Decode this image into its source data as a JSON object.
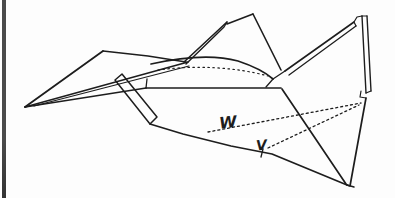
{
  "colors": {
    "ink": "#1d1d1d",
    "paper": "#fdfdfd",
    "left_bar": "#4b4b4b"
  },
  "figure": {
    "labels": [
      {
        "id": "W",
        "text": "W"
      },
      {
        "id": "V",
        "text": "V"
      }
    ],
    "paths": [
      {
        "name": "left-wing-top-edge",
        "d": "M25,107 L103,51",
        "w": 1.8
      },
      {
        "name": "left-wing-upper-rear-edge",
        "d": "M103,51 L148,56 L186,62",
        "w": 1.6
      },
      {
        "name": "left-wing-trailing-edge-outer",
        "d": "M25,107 L188,62",
        "w": 1.6
      },
      {
        "name": "left-wing-trailing-edge-inner",
        "d": "M34,106 L189,66",
        "w": 1.2
      },
      {
        "name": "left-wing-bottom-edge",
        "d": "M25,107 L146,88",
        "w": 1.5
      },
      {
        "name": "keel-strip",
        "d": "M115,80 L122,74 L157,117 L150,124 Z",
        "w": 1.5
      },
      {
        "name": "center-spike-left-edge",
        "d": "M184,62 L227,22",
        "w": 1.6
      },
      {
        "name": "center-spike-right-edge",
        "d": "M186,64 L224,27 L227,22",
        "w": 1.4
      },
      {
        "name": "center-peak-left-edge",
        "d": "M227,24 L253,14",
        "w": 1.6
      },
      {
        "name": "center-peak-right-edge",
        "d": "M253,14 L281,70",
        "w": 1.6
      },
      {
        "name": "body-top-curve",
        "d": "M151,64 Q205,52 238,61 Q262,69 273,79",
        "w": 1.7
      },
      {
        "name": "body-left-edge",
        "d": "M147,79 L146,88",
        "w": 1.3
      },
      {
        "name": "body-bottom-edge",
        "d": "M146,88 L281,88",
        "w": 1.6
      },
      {
        "name": "body-rear-notch",
        "d": "M273,79 L266,87",
        "w": 1.3
      },
      {
        "name": "body-to-wing-connector",
        "d": "M273,79 L285,71",
        "w": 1.3
      },
      {
        "name": "center-crease-diagonal",
        "d": "M282,89 L346,184",
        "w": 1.7
      },
      {
        "name": "bottom-edge",
        "d": "M150,124 L183,134 L231,146 L272,154 L347,185",
        "w": 1.7
      },
      {
        "name": "bottom-vertex-foot",
        "d": "M347,185 L354,187",
        "w": 1.4
      },
      {
        "name": "right-wing-leading-edge-outer",
        "d": "M285,71 L354,22",
        "w": 1.6
      },
      {
        "name": "right-wing-leading-edge-inner",
        "d": "M289,75 L356,26",
        "w": 1.3
      },
      {
        "name": "right-wing-peak-notch",
        "d": "M354,22 L356,26 M354,22 L357,17 L362,16",
        "w": 1.2
      },
      {
        "name": "right-strip-left-edge",
        "d": "M362,16 L366,93",
        "w": 1.4
      },
      {
        "name": "right-strip-right-edge",
        "d": "M367,16 L371,91",
        "w": 1.4
      },
      {
        "name": "right-strip-caps",
        "d": "M362,16 L367,16 M366,93 L371,91",
        "w": 1.2
      },
      {
        "name": "right-strip-foot-notch",
        "d": "M361,91 L360,97 L366,98",
        "w": 1.2
      },
      {
        "name": "right-edge",
        "d": "M366,98 L350,186 L347,185",
        "w": 1.7
      },
      {
        "name": "fold-line-w",
        "d": "M208,132 L361,103",
        "w": 1.3,
        "dash": "2,3"
      },
      {
        "name": "fold-line-v",
        "d": "M268,148 L359,105",
        "w": 1.3,
        "dash": "2,3"
      },
      {
        "name": "body-crease-dotted",
        "d": "M158,70 C195,65 235,67 268,76",
        "w": 1.2,
        "dash": "1.5,3.5"
      },
      {
        "name": "label-v-tail",
        "d": "M263,149 L261,157",
        "w": 1.3
      }
    ]
  }
}
